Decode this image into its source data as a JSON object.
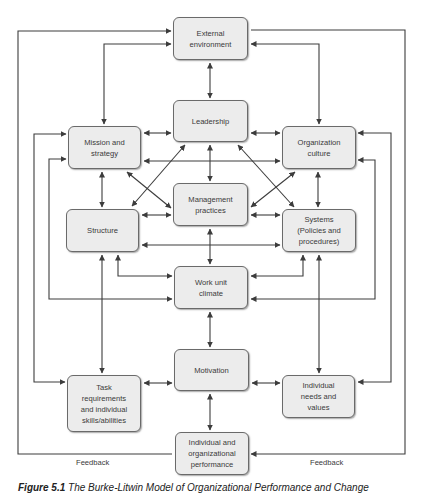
{
  "diagram": {
    "title": "Burke-Litwin Model of Organizational Performance and Change",
    "boxes": {
      "external_environment": "External\nenvironment",
      "leadership": "Leadership",
      "mission_strategy": "Mission and\nstrategy",
      "organization_culture": "Organization\nculture",
      "management_practices": "Management\npractices",
      "structure": "Structure",
      "systems": "Systems\n(Policies and\nprocedures)",
      "work_unit_climate": "Work unit\nclimate",
      "motivation": "Motivation",
      "task_requirements": "Task\nrequirements\nand individual\nskills/abilities",
      "individual_needs": "Individual\nneeds and\nvalues",
      "performance": "Individual and\norganizational\nperformance"
    },
    "feedback_labels": {
      "left": "Feedback",
      "right": "Feedback"
    },
    "colors": {
      "box_fill": "#ececec",
      "box_border": "#6a6a6a",
      "line": "#3c3c3c",
      "text": "#3a3a3a"
    }
  },
  "caption": {
    "prefix": "Figure 5.1",
    "text": "The Burke-Litwin Model of Organizational Performance and Change"
  }
}
